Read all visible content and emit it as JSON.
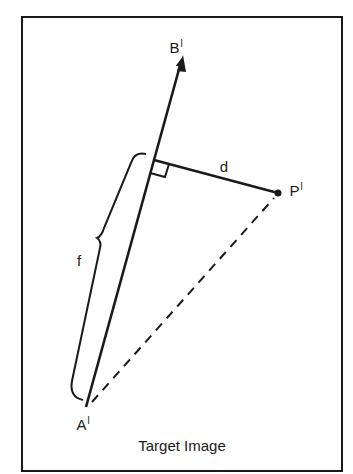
{
  "diagram": {
    "caption": "Target Image",
    "labels": {
      "B": "B",
      "B_prime": "l",
      "A": "A",
      "A_prime": "l",
      "P": "P",
      "P_prime": "l",
      "d": "d",
      "f": "f"
    },
    "elements": [
      {
        "type": "arrow",
        "from": "A'",
        "to": "B'",
        "style": "solid"
      },
      {
        "type": "segment",
        "from": "foot",
        "to": "P'",
        "label": "d",
        "style": "solid"
      },
      {
        "type": "segment",
        "from": "A'",
        "to": "P'",
        "style": "dashed"
      },
      {
        "type": "right-angle-marker",
        "at": "foot"
      },
      {
        "type": "brace",
        "span": "A' to foot",
        "label": "f"
      },
      {
        "type": "point",
        "name": "P'"
      }
    ],
    "colors": {
      "ink": "#1a1a1a",
      "background": "#ffffff"
    }
  }
}
